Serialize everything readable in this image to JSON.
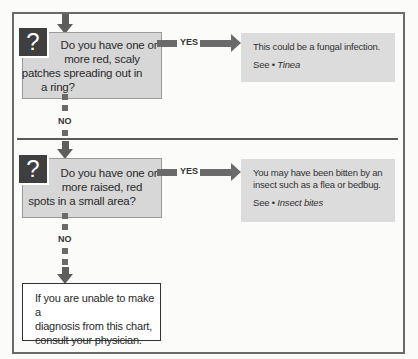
{
  "flowchart": {
    "questions": [
      {
        "icon": "?",
        "text": "Do you have one or more red, scaly patches spreading out in a ring?",
        "lines": [
          "Do you have one or",
          "more red, scaly",
          "patches spreading out in",
          "a ring?"
        ],
        "yes_label": "YES",
        "no_label": "NO",
        "answer": {
          "text": "This could be a fungal infection.",
          "lines": [
            "This could be a fungal infection."
          ],
          "see_prefix": "See • ",
          "see_link": "Tinea"
        }
      },
      {
        "icon": "?",
        "text": "Do you have one or more raised, red spots in a small area?",
        "lines": [
          "Do you have one or",
          "more raised, red",
          "spots in a small area?"
        ],
        "yes_label": "YES",
        "no_label": "NO",
        "answer": {
          "text": "You may have been bitten by an insect such as a flea or bedbug.",
          "lines": [
            "You may have been bitten by an",
            "insect such as a flea or bedbug."
          ],
          "see_prefix": "See • ",
          "see_link": "Insect bites"
        }
      }
    ],
    "final": {
      "lines": [
        "If you are unable to make a",
        "diagnosis from this chart,",
        "consult your physician."
      ]
    },
    "colors": {
      "question_box": "#d7d7d7",
      "answer_box": "#dcdcdc",
      "icon_bg": "#3f3f3f",
      "arrow": "#6a6a6a",
      "frame": "#6a6a6a"
    }
  }
}
